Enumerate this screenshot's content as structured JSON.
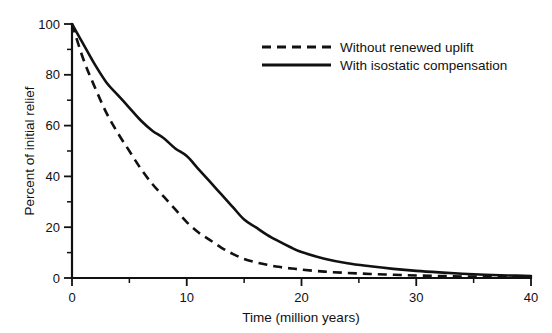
{
  "chart_data": {
    "type": "line",
    "title": "",
    "xlabel": "Time (million years)",
    "ylabel": "Percent of initial relief",
    "xlim": [
      0,
      40
    ],
    "ylim": [
      0,
      100
    ],
    "grid": false,
    "legend_position": "top-right",
    "x_ticks_major": [
      0,
      10,
      20,
      30,
      40
    ],
    "x_ticks_minor": [
      5,
      15,
      25,
      35
    ],
    "x_tick_labels": [
      "0",
      "10",
      "20",
      "30",
      "40"
    ],
    "y_ticks_major": [
      0,
      20,
      40,
      60,
      80,
      100
    ],
    "y_ticks_minor": [
      10,
      30,
      50,
      70,
      90
    ],
    "y_tick_labels": [
      "0",
      "20",
      "40",
      "60",
      "80",
      "100"
    ],
    "x": [
      0,
      1,
      2,
      3,
      4,
      5,
      6,
      7,
      8,
      9,
      10,
      11,
      12,
      13,
      14,
      15,
      16,
      17,
      18,
      19,
      20,
      22,
      24,
      26,
      28,
      30,
      32,
      34,
      36,
      38,
      40
    ],
    "series": [
      {
        "name": "Without renewed uplift",
        "style": "dashed",
        "color": "#111111",
        "values": [
          100,
          86,
          75,
          65,
          57,
          50,
          43,
          37,
          32,
          27,
          22,
          18,
          15,
          12,
          9.5,
          7.5,
          6.2,
          5.2,
          4.4,
          3.8,
          3.3,
          2.5,
          2.0,
          1.6,
          1.3,
          1.0,
          0.8,
          0.6,
          0.5,
          0.4,
          0.3
        ]
      },
      {
        "name": "With isostatic compensation",
        "style": "solid",
        "color": "#111111",
        "values": [
          100,
          92,
          84,
          77,
          72,
          67,
          62,
          58,
          55,
          51,
          48,
          43,
          38,
          33,
          28,
          23,
          20,
          17,
          14.5,
          12.2,
          10.2,
          7.6,
          5.8,
          4.6,
          3.6,
          2.8,
          2.2,
          1.7,
          1.3,
          1.0,
          0.8
        ]
      }
    ]
  },
  "legend": {
    "entries": [
      {
        "label": "Without renewed uplift",
        "style": "dashed"
      },
      {
        "label": "With isostatic compensation",
        "style": "solid"
      }
    ]
  },
  "axes": {
    "x_title": "Time (million years)",
    "y_title": "Percent of initial relief"
  }
}
